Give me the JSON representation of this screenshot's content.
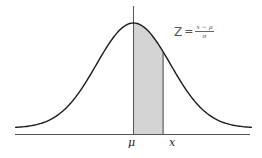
{
  "diagram": {
    "formula": {
      "lhs": "Z",
      "eq": "=",
      "numerator": "x − μ",
      "denominator": "σ"
    },
    "axis_labels": {
      "mean": "μ",
      "x": "x"
    },
    "colors": {
      "curve": "#1a1a1a",
      "shade": "#d4d4d4",
      "axis": "#555555",
      "text": "#222222"
    }
  },
  "chart_data": {
    "type": "area",
    "title": "",
    "xlabel": "",
    "ylabel": "",
    "tick_labels": [
      "μ",
      "x"
    ],
    "shaded_region": {
      "from": "μ",
      "to": "x",
      "from_sd": 0,
      "to_sd": 0.8
    },
    "annotation": "Z = (x − μ) / σ",
    "x_range_sd": [
      -3.2,
      3.2
    ],
    "grid": false
  }
}
